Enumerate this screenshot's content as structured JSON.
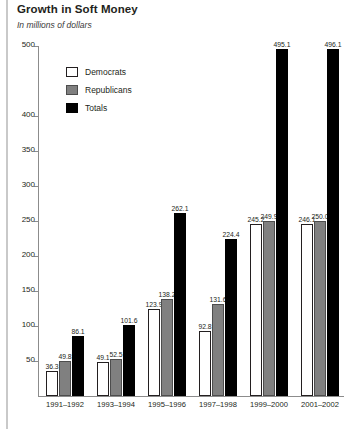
{
  "header": {
    "title": "Growth in Soft Money",
    "subtitle": "In millions of dollars"
  },
  "legend": {
    "position": "upper-left-inside",
    "items": [
      {
        "label": "Democrats",
        "color": "#ffffff",
        "border": "#231f20"
      },
      {
        "label": "Republicans",
        "color": "#808080",
        "border": "#4d4d4d"
      },
      {
        "label": "Totals",
        "color": "#000000",
        "border": "#000000"
      }
    ]
  },
  "chart_data": {
    "type": "bar",
    "title": "Growth in Soft Money",
    "subtitle": "In millions of dollars",
    "xlabel": "",
    "ylabel": "",
    "ylim": [
      0,
      500
    ],
    "yticks": [
      50,
      100,
      150,
      200,
      250,
      300,
      350,
      400,
      500
    ],
    "ytick_labels": [
      "50",
      "100",
      "150",
      "200",
      "250",
      "300",
      "350",
      "400",
      "500"
    ],
    "grid": false,
    "categories": [
      "1991–1992",
      "1993–1994",
      "1995–1996",
      "1997–1998",
      "1999–2000",
      "2001–2002"
    ],
    "series": [
      {
        "name": "Democrats",
        "color": "#ffffff",
        "border": "#231f20",
        "values": [
          36.3,
          49.1,
          123.9,
          92.8,
          245.2,
          246.1
        ],
        "labels": [
          "36.3",
          "49.1",
          "123.9",
          "92.8",
          "245.2",
          "246.1"
        ]
      },
      {
        "name": "Republicans",
        "color": "#808080",
        "border": "#4d4d4d",
        "values": [
          49.8,
          52.5,
          138.2,
          131.6,
          249.9,
          250.0
        ],
        "labels": [
          "49.8",
          "52.5",
          "138.2",
          "131.6",
          "249.9",
          "250.0"
        ]
      },
      {
        "name": "Totals",
        "color": "#000000",
        "border": "#000000",
        "values": [
          86.1,
          101.6,
          262.1,
          224.4,
          495.1,
          496.1
        ],
        "labels": [
          "86.1",
          "101.6",
          "262.1",
          "224.4",
          "495.1",
          "496.1"
        ]
      }
    ]
  }
}
